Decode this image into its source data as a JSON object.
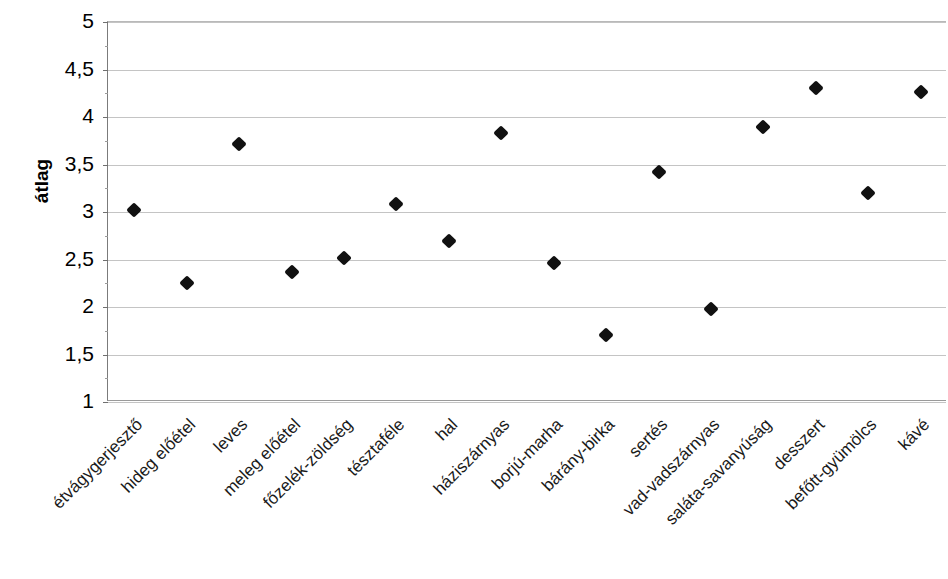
{
  "chart_data": {
    "type": "scatter",
    "title": "",
    "xlabel": "",
    "ylabel": "átlag",
    "ylim": [
      1,
      5
    ],
    "ytick_step": 0.5,
    "grid": true,
    "legend": false,
    "decimal_separator": ",",
    "marker": "filled-diamond",
    "marker_color": "#111111",
    "categories": [
      "étvágygerjesztő",
      "hideg előétel",
      "leves",
      "meleg előétel",
      "főzelék-zöldség",
      "tésztaféle",
      "hal",
      "háziszárnyas",
      "borjú-marha",
      "bárány-birka",
      "sertés",
      "vad-vadszárnyas",
      "saláta-savanyúság",
      "desszert",
      "befőtt-gyümölcs",
      "kávé"
    ],
    "values": [
      3.02,
      2.25,
      3.72,
      2.37,
      2.52,
      3.08,
      2.69,
      3.83,
      2.46,
      1.71,
      3.42,
      1.98,
      3.9,
      4.31,
      3.2,
      4.26
    ],
    "ytick_labels": [
      "5",
      "4,5",
      "4",
      "3,5",
      "3",
      "2,5",
      "2",
      "1,5",
      "1"
    ],
    "ytick_values": [
      5,
      4.5,
      4,
      3.5,
      3,
      2.5,
      2,
      1.5,
      1
    ]
  }
}
